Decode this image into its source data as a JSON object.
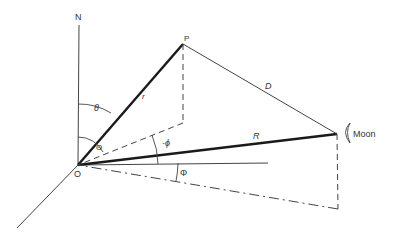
{
  "diagram": {
    "labels": {
      "north": "N",
      "point_p": "P",
      "origin": "O",
      "moon": "Moon",
      "r": "r",
      "d": "D",
      "big_r": "R",
      "theta_small": "θ",
      "theta_big": "Θ",
      "phi_small": "-ϕ",
      "phi_big": "Φ"
    },
    "colors": {
      "line": "#333333",
      "heavy": "#1a1a1a",
      "background": "#ffffff"
    }
  }
}
